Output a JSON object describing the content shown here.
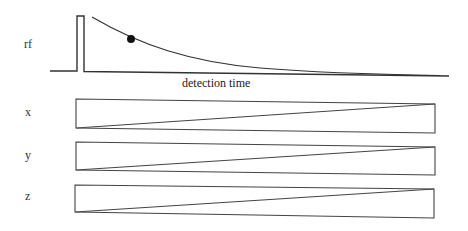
{
  "diagram": {
    "rows": [
      {
        "id": "rf",
        "label": "rf"
      },
      {
        "id": "x",
        "label": "x"
      },
      {
        "id": "y",
        "label": "y"
      },
      {
        "id": "z",
        "label": "z"
      }
    ],
    "rf_axis_label": "detection time",
    "elements": {
      "rf_pulse": "rectangular rf pulse",
      "signal_curve": "exponential decay (FID) curve",
      "sample_point": "filled dot on decay curve",
      "gradients": "ramped gradient waveforms on x, y, z"
    },
    "colors": {
      "line": "#333333",
      "text": "#222222",
      "background": "#ffffff"
    }
  }
}
